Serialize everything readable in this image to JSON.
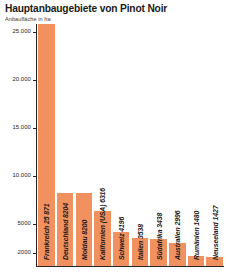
{
  "chart_data": {
    "type": "bar",
    "title": "Hauptanbaugebiete von Pinot Noir",
    "subtitle": "Anbaufläche in ha",
    "xlabel": "",
    "ylabel": "",
    "grid": false,
    "legend": null,
    "orientation": "vertical",
    "bar_color": "#f0915f",
    "axis_color": "#2b2320",
    "ylim": [
      0,
      26500
    ],
    "yticks": [
      2000,
      5000,
      10000,
      15000,
      20000,
      25000
    ],
    "ytick_labels": [
      "2000",
      "5000",
      "10.000",
      "15.000",
      "20.000",
      "25.000"
    ],
    "categories": [
      "Frankreich",
      "Deutschland",
      "Moldau",
      "Kalifornien (USA)",
      "Schweiz",
      "Italien",
      "Südafrika",
      "Australien",
      "Rumänien",
      "Neuseeland"
    ],
    "values": [
      25871,
      8204,
      8200,
      6316,
      4196,
      3538,
      3438,
      2996,
      1480,
      1427
    ],
    "bar_labels": [
      "Frankreich 25 871",
      "Deutschland 8204",
      "Moldau 8200",
      "Kalifornien (USA) 6316",
      "Schweiz 4196",
      "Italien 3538",
      "Südafrika 3438",
      "Australien 2996",
      "Rumänien 1480",
      "Neuseeland 1427"
    ]
  }
}
